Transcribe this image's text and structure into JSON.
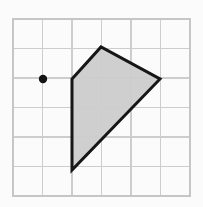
{
  "figure": {
    "canvas": {
      "width": 203,
      "height": 207,
      "background_color": "#fbfbfb"
    },
    "grid": {
      "name": "square-grid",
      "columns": 6,
      "rows": 6,
      "cell_size_px": 29.5,
      "origin_px": {
        "x": 13,
        "y": 19
      },
      "extent_px": {
        "x": 190,
        "y": 196
      },
      "line_color": "#cdcdcd",
      "border_color": "#c6c6c6",
      "visible": true
    },
    "point": {
      "name": "marker-dot",
      "label": "",
      "grid_coords": {
        "x": 1,
        "y": 2
      },
      "pixel_coords": {
        "x": 43,
        "y": 79
      },
      "radius_px": 4.2,
      "color": "#141414"
    },
    "polygon": {
      "name": "shaded-quadrilateral",
      "sides": 4,
      "fill_color": "#cccccc",
      "stroke_color": "#161616",
      "stroke_width_px": 3,
      "vertices_grid": [
        {
          "x": 2,
          "y": 2
        },
        {
          "x": 3,
          "y": 1
        },
        {
          "x": 5,
          "y": 2
        },
        {
          "x": 2,
          "y": 5
        }
      ],
      "vertices_px": [
        {
          "x": 72,
          "y": 79
        },
        {
          "x": 101,
          "y": 47
        },
        {
          "x": 160,
          "y": 79
        },
        {
          "x": 72,
          "y": 170
        }
      ],
      "points_attr": "72,79 101,47 160,79 72,170"
    }
  }
}
